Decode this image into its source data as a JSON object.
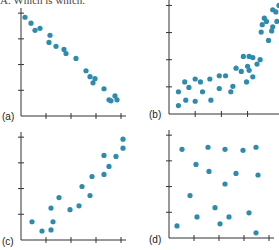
{
  "header": {
    "text": "A. Which is which."
  },
  "chart_data": [
    {
      "type": "scatter",
      "panel_label": "(a)",
      "title": "",
      "xlabel": "",
      "ylabel": "",
      "xlim": [
        0,
        4.2
      ],
      "ylim": [
        0,
        4.2
      ],
      "xticks": [
        1,
        2,
        3,
        4
      ],
      "yticks": [
        1,
        2,
        3,
        4
      ],
      "grid": false,
      "points": [
        [
          0.16,
          3.84
        ],
        [
          0.4,
          3.61
        ],
        [
          0.56,
          3.33
        ],
        [
          0.76,
          3.41
        ],
        [
          1.16,
          3.14
        ],
        [
          1.12,
          2.86
        ],
        [
          1.4,
          2.71
        ],
        [
          1.72,
          2.59
        ],
        [
          1.8,
          2.43
        ],
        [
          2.2,
          2.24
        ],
        [
          2.6,
          1.76
        ],
        [
          2.76,
          1.53
        ],
        [
          2.96,
          1.45
        ],
        [
          2.88,
          1.29
        ],
        [
          3.32,
          1.06
        ],
        [
          3.52,
          0.63
        ],
        [
          3.6,
          0.59
        ],
        [
          3.76,
          0.78
        ],
        [
          3.84,
          0.63
        ]
      ]
    },
    {
      "type": "scatter",
      "panel_label": "(b)",
      "title": "",
      "xlabel": "",
      "ylabel": "",
      "xlim": [
        0,
        4.2
      ],
      "ylim": [
        0,
        4.2
      ],
      "xticks": [
        1,
        2,
        3
      ],
      "yticks": [
        1,
        2,
        3,
        4
      ],
      "grid": false,
      "points": [
        [
          0.36,
          0.31
        ],
        [
          0.36,
          0.82
        ],
        [
          0.64,
          0.51
        ],
        [
          0.6,
          1.18
        ],
        [
          0.76,
          0.98
        ],
        [
          1.0,
          0.47
        ],
        [
          1.0,
          1.29
        ],
        [
          1.2,
          1.18
        ],
        [
          1.28,
          0.82
        ],
        [
          1.6,
          0.51
        ],
        [
          1.56,
          1.29
        ],
        [
          1.92,
          1.41
        ],
        [
          1.92,
          0.94
        ],
        [
          2.16,
          1.41
        ],
        [
          2.36,
          0.82
        ],
        [
          2.44,
          1.02
        ],
        [
          2.56,
          1.69
        ],
        [
          2.76,
          1.57
        ],
        [
          2.84,
          2.12
        ],
        [
          2.96,
          1.18
        ],
        [
          3.06,
          1.61
        ],
        [
          3.06,
          2.12
        ],
        [
          3.2,
          2.08
        ],
        [
          3.0,
          1.76
        ],
        [
          3.2,
          1.37
        ],
        [
          3.36,
          1.84
        ],
        [
          3.48,
          2.0
        ],
        [
          3.52,
          3.02
        ],
        [
          3.56,
          3.29
        ],
        [
          3.64,
          3.53
        ],
        [
          3.72,
          3.41
        ],
        [
          3.96,
          3.84
        ],
        [
          4.08,
          3.76
        ],
        [
          3.96,
          3.21
        ],
        [
          3.92,
          3.06
        ],
        [
          3.8,
          2.71
        ],
        [
          4.12,
          3.41
        ],
        [
          4.2,
          4.0
        ]
      ]
    },
    {
      "type": "scatter",
      "panel_label": "(c)",
      "title": "",
      "xlabel": "",
      "ylabel": "",
      "xlim": [
        0,
        4.2
      ],
      "ylim": [
        0,
        4.2
      ],
      "xticks": [
        1,
        2,
        3,
        4
      ],
      "yticks": [
        1,
        2,
        3,
        4
      ],
      "grid": false,
      "points": [
        [
          0.44,
          0.71
        ],
        [
          0.84,
          0.35
        ],
        [
          1.2,
          0.39
        ],
        [
          1.28,
          0.71
        ],
        [
          1.2,
          1.24
        ],
        [
          1.52,
          1.65
        ],
        [
          1.96,
          1.18
        ],
        [
          2.32,
          1.33
        ],
        [
          2.44,
          2.08
        ],
        [
          2.76,
          1.73
        ],
        [
          2.84,
          2.47
        ],
        [
          3.32,
          2.55
        ],
        [
          3.52,
          2.86
        ],
        [
          3.32,
          3.29
        ],
        [
          3.8,
          3.25
        ],
        [
          4.08,
          3.57
        ],
        [
          4.08,
          3.92
        ]
      ]
    },
    {
      "type": "scatter",
      "panel_label": "(d)",
      "title": "",
      "xlabel": "",
      "ylabel": "",
      "xlim": [
        0,
        4.2
      ],
      "ylim": [
        0,
        4.2
      ],
      "xticks": [
        1,
        2,
        3,
        4
      ],
      "yticks": [
        1,
        2,
        3,
        4
      ],
      "grid": false,
      "points": [
        [
          0.32,
          0.47
        ],
        [
          0.52,
          3.45
        ],
        [
          1.12,
          0.82
        ],
        [
          1.08,
          2.86
        ],
        [
          1.56,
          3.53
        ],
        [
          1.6,
          2.59
        ],
        [
          0.84,
          1.65
        ],
        [
          1.84,
          1.18
        ],
        [
          2.04,
          0.55
        ],
        [
          2.24,
          3.45
        ],
        [
          2.24,
          2.1
        ],
        [
          2.4,
          0.82
        ],
        [
          2.68,
          2.51
        ],
        [
          2.96,
          3.41
        ],
        [
          3.2,
          0.98
        ],
        [
          3.48,
          3.53
        ],
        [
          3.56,
          2.45
        ],
        [
          3.48,
          0.2
        ]
      ]
    }
  ]
}
